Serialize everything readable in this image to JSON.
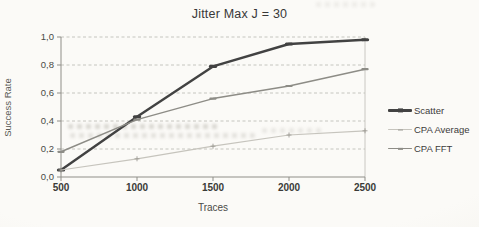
{
  "title": "Jitter Max J = 30",
  "chart_data": {
    "type": "line",
    "title": "Jitter Max J = 30",
    "xlabel": "Traces",
    "ylabel": "Success Rate",
    "categories": [
      500,
      1000,
      1500,
      2000,
      2500
    ],
    "x_tick_labels": [
      "500",
      "1000",
      "1500",
      "2000",
      "2500"
    ],
    "y_tick_values": [
      1.0,
      0.8,
      0.6,
      0.4,
      0.2,
      0.0
    ],
    "y_tick_labels": [
      "1,0",
      "0,8",
      "0,6",
      "0,4",
      "0,2",
      "0,0"
    ],
    "ylim": [
      0,
      1
    ],
    "xlim": [
      500,
      2500
    ],
    "grid": true,
    "legend_position": "right",
    "series": [
      {
        "name": "Scatter",
        "values": [
          0.05,
          0.43,
          0.79,
          0.95,
          0.98
        ],
        "color": "#424242",
        "width": 2.4,
        "marker": "dash"
      },
      {
        "name": "CPA Average",
        "values": [
          0.05,
          0.13,
          0.22,
          0.3,
          0.33
        ],
        "color": "#c6c4bd",
        "width": 1.2,
        "marker": "plus",
        "marker_color": "#9c9a93"
      },
      {
        "name": "CPA FFT",
        "values": [
          0.18,
          0.41,
          0.56,
          0.65,
          0.77
        ],
        "color": "#8d8c86",
        "width": 1.5,
        "marker": "dash"
      }
    ]
  },
  "colors": {
    "paper": "#f7f6f2",
    "grid": "#b9b8b1",
    "frame": "#c3c2bb",
    "axis": "#8f8e88",
    "tick_text": "#4a4a46",
    "x_tick_text": "#3a3a38",
    "title_text": "#383838"
  }
}
